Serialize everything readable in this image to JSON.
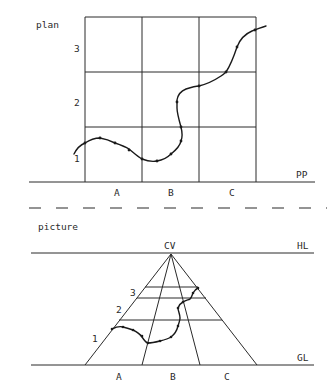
{
  "plan": {
    "title": "plan",
    "row_labels": [
      "1",
      "2",
      "3"
    ],
    "column_labels": [
      "A",
      "B",
      "C"
    ],
    "baseline_label": "PP"
  },
  "picture": {
    "title": "picture",
    "vanishing_point_label": "CV",
    "horizon_label": "HL",
    "ground_label": "GL",
    "row_labels": [
      "1",
      "2",
      "3"
    ],
    "column_labels": [
      "A",
      "B",
      "C"
    ]
  },
  "colors": {
    "line": "#2a2a2a",
    "background": "#ffffff"
  }
}
